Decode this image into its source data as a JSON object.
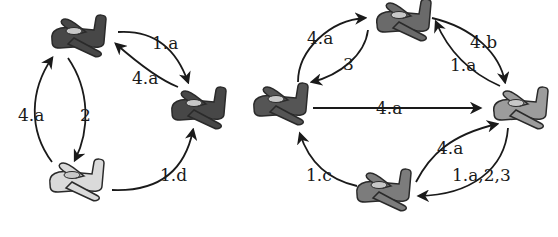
{
  "diagrams": [
    {
      "id": "left",
      "nodes": [
        {
          "id": "L1",
          "shade": "dark",
          "fill": "#4a4a4a"
        },
        {
          "id": "L2",
          "shade": "dark",
          "fill": "#4a4a4a"
        },
        {
          "id": "L3",
          "shade": "light",
          "fill": "#d8d8d8"
        }
      ],
      "edges": [
        {
          "from": "L1",
          "to": "L2",
          "label": "1.a"
        },
        {
          "from": "L2",
          "to": "L1",
          "label": "4.a"
        },
        {
          "from": "L1",
          "to": "L3",
          "label": "2"
        },
        {
          "from": "L3",
          "to": "L1",
          "label": "4.a"
        },
        {
          "from": "L3",
          "to": "L2",
          "label": "1.d"
        }
      ]
    },
    {
      "id": "right",
      "nodes": [
        {
          "id": "R_top",
          "shade": "medium",
          "fill": "#6e6e6e"
        },
        {
          "id": "R_left",
          "shade": "dark",
          "fill": "#555555"
        },
        {
          "id": "R_right",
          "shade": "light-medium",
          "fill": "#9a9a9a"
        },
        {
          "id": "R_bottom",
          "shade": "medium",
          "fill": "#7a7a7a"
        }
      ],
      "edges": [
        {
          "from": "R_left",
          "to": "R_top",
          "label": "4.a"
        },
        {
          "from": "R_top",
          "to": "R_left",
          "label": "3"
        },
        {
          "from": "R_top",
          "to": "R_right",
          "label": "4.b"
        },
        {
          "from": "R_right",
          "to": "R_top",
          "label": "1.a"
        },
        {
          "from": "R_left",
          "to": "R_right",
          "label": "4.a"
        },
        {
          "from": "R_bottom",
          "to": "R_right",
          "label": "4.a"
        },
        {
          "from": "R_right",
          "to": "R_bottom",
          "label": "1.a,2,3"
        },
        {
          "from": "R_bottom",
          "to": "R_left",
          "label": "1.c"
        }
      ]
    }
  ],
  "labels": {
    "l_1a": "1.a",
    "l_4a_top": "4.a",
    "l_4a_left": "4.a",
    "l_2": "2",
    "l_1d": "1.d",
    "r_4a_tl": "4.a",
    "r_3": "3",
    "r_4b": "4.b",
    "r_1a": "1.a",
    "r_4a_mid": "4.a",
    "r_4a_br": "4.a",
    "r_1a23": "1.a,2,3",
    "r_1c": "1.c"
  }
}
